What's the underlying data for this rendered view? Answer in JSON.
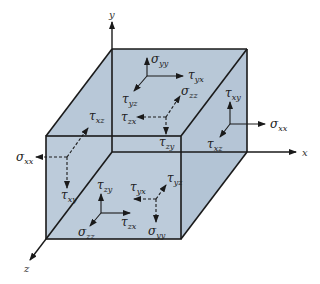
{
  "figure": {
    "face_color": "#b8c8d8",
    "edge_color": "#1a1a1a",
    "axes": [
      {
        "name": "x",
        "label": "x"
      },
      {
        "name": "y",
        "label": "y"
      },
      {
        "name": "z",
        "label": "z"
      }
    ],
    "labels": {
      "sigma_yy_top": {
        "sym": "σ",
        "sub": "yy"
      },
      "tau_yx_top": {
        "sym": "τ",
        "sub": "yx"
      },
      "tau_yz_top": {
        "sym": "τ",
        "sub": "yz"
      },
      "sigma_zz_back": {
        "sym": "σ",
        "sub": "zz"
      },
      "tau_zx_back": {
        "sym": "τ",
        "sub": "zx"
      },
      "tau_zy_back": {
        "sym": "τ",
        "sub": "zy"
      },
      "tau_xy_right": {
        "sym": "τ",
        "sub": "xy"
      },
      "sigma_xx_right": {
        "sym": "σ",
        "sub": "xx"
      },
      "tau_xz_right": {
        "sym": "τ",
        "sub": "xz"
      },
      "tau_xz_left": {
        "sym": "τ",
        "sub": "xz"
      },
      "sigma_xx_left": {
        "sym": "σ",
        "sub": "xx"
      },
      "tau_xy_left": {
        "sym": "τ",
        "sub": "xy"
      },
      "tau_zy_front": {
        "sym": "τ",
        "sub": "zy"
      },
      "tau_zx_front": {
        "sym": "τ",
        "sub": "zx"
      },
      "sigma_zz_front": {
        "sym": "σ",
        "sub": "zz"
      },
      "tau_yx_bottom": {
        "sym": "τ",
        "sub": "yx"
      },
      "tau_yz_bottom": {
        "sym": "τ",
        "sub": "yz"
      },
      "sigma_yy_bottom": {
        "sym": "σ",
        "sub": "yy"
      }
    }
  }
}
